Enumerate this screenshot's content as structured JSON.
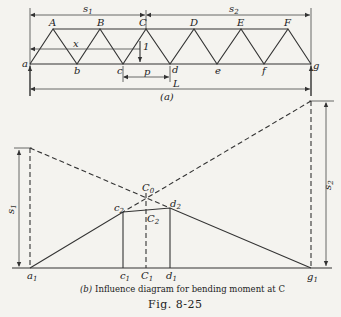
{
  "part_a": {
    "top_nodes": [
      "A",
      "B",
      "C",
      "D",
      "E",
      "F"
    ],
    "bottom_nodes": [
      "a",
      "b",
      "c",
      "d",
      "e",
      "f",
      "g"
    ],
    "dimensions": {
      "s1": "s",
      "s1_sub": "1",
      "s2": "s",
      "s2_sub": "2",
      "x": "x",
      "p": "p",
      "L": "L"
    },
    "unit_load": "1",
    "label": "(a)"
  },
  "part_b": {
    "points": {
      "a1": "a",
      "a1_sub": "1",
      "c1": "c",
      "c1_sub": "1",
      "C1": "C",
      "C1_sub": "1",
      "d1": "d",
      "d1_sub": "1",
      "g1": "g",
      "g1_sub": "1",
      "c2": "c",
      "c2_sub": "2",
      "C2": "C",
      "C2_sub": "2",
      "d2": "d",
      "d2_sub": "2",
      "C0": "C",
      "C0_sub": "0"
    },
    "dimensions": {
      "s1": "s",
      "s1_sub": "1",
      "s2": "s",
      "s2_sub": "2"
    },
    "caption_prefix": "(b)",
    "caption": "Influence diagram for bending moment at C"
  },
  "figure_label": "Fig. 8-25"
}
